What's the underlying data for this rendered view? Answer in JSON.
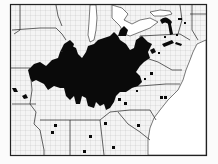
{
  "map": {
    "subject": "Distribution range map of the eastern United States (county outlines)",
    "region": "Eastern United States",
    "legend": null,
    "colors": {
      "background": "#fbfbfb",
      "land": "#f2f2f2",
      "county_lines": "#9a9a9a",
      "state_lines": "#222222",
      "range_fill": "#0a0a0a",
      "water": "#ffffff"
    },
    "range": {
      "description": "Solid black range covering the Ohio Valley and lower Midwest (southern Illinois/Indiana/Ohio, Kentucky, West Virginia, western Pennsylvania, northern Tennessee, Missouri portions)"
    },
    "isolated_records": {
      "count_approx": 20,
      "description": "Scattered small black squares/dots marking outlying county records across the Northeast, Mid-Atlantic and Southeast"
    }
  }
}
